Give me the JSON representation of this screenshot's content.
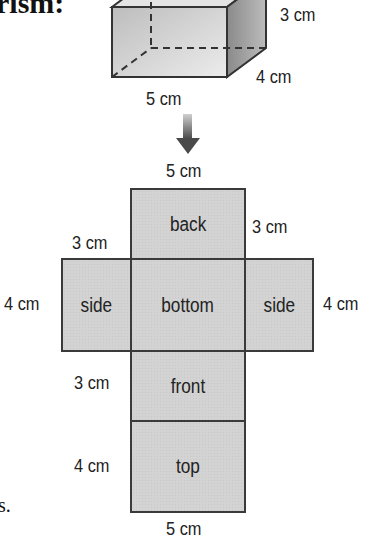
{
  "heading_fragment": "rism:",
  "trailing_fragment": "s.",
  "prism": {
    "labels": {
      "height": "3 cm",
      "depth": "4 cm",
      "width": "5 cm"
    },
    "colors": {
      "front": "#d8d8d8",
      "side": "#9a9a9a",
      "edge": "#3a3a3a"
    }
  },
  "arrow": {
    "direction": "down",
    "color": "#555555"
  },
  "net": {
    "faces": [
      {
        "name": "back",
        "label": "back"
      },
      {
        "name": "side-left",
        "label": "side"
      },
      {
        "name": "bottom",
        "label": "bottom"
      },
      {
        "name": "side-right",
        "label": "side"
      },
      {
        "name": "front",
        "label": "front"
      },
      {
        "name": "top",
        "label": "top"
      }
    ],
    "dimensions": {
      "top_width": "5 cm",
      "back_left_height": "3 cm",
      "back_right_height": "3 cm",
      "left_side_height": "4 cm",
      "right_side_height": "4 cm",
      "front_height": "3 cm",
      "top_height": "4 cm",
      "bottom_width": "5 cm"
    },
    "fill_color": "#d3d3d3"
  }
}
